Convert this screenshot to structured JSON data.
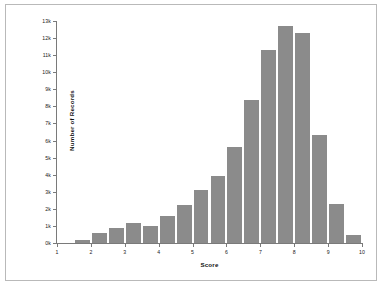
{
  "chart_data": {
    "type": "bar",
    "title": "",
    "subtitle": "",
    "xlabel": "Score",
    "ylabel": "Number of Records",
    "xlim": [
      1,
      10
    ],
    "ylim": [
      0,
      13000
    ],
    "grid": false,
    "legend": null,
    "bin_width": 0.5,
    "bar_color": "#8b8b8b",
    "y_ticks": [
      0,
      1000,
      2000,
      3000,
      4000,
      5000,
      6000,
      7000,
      8000,
      9000,
      10000,
      11000,
      12000,
      13000
    ],
    "y_tick_labels": [
      "0k",
      "1k",
      "2k",
      "3k",
      "4k",
      "5k",
      "6k",
      "7k",
      "8k",
      "9k",
      "10k",
      "11k",
      "12k",
      "13k"
    ],
    "x_ticks": [
      1,
      2,
      3,
      4,
      5,
      6,
      7,
      8,
      9,
      10
    ],
    "x_tick_labels": [
      "1",
      "2",
      "3",
      "4",
      "5",
      "6",
      "7",
      "8",
      "9",
      "10"
    ],
    "bins": [
      {
        "start": 1.0,
        "end": 1.5,
        "center": 1.25,
        "value": 0
      },
      {
        "start": 1.5,
        "end": 2.0,
        "center": 1.75,
        "value": 150
      },
      {
        "start": 2.0,
        "end": 2.5,
        "center": 2.25,
        "value": 600
      },
      {
        "start": 2.5,
        "end": 3.0,
        "center": 2.75,
        "value": 900
      },
      {
        "start": 3.0,
        "end": 3.5,
        "center": 3.25,
        "value": 1200
      },
      {
        "start": 3.5,
        "end": 4.0,
        "center": 3.75,
        "value": 1000
      },
      {
        "start": 4.0,
        "end": 4.5,
        "center": 4.25,
        "value": 1600
      },
      {
        "start": 4.5,
        "end": 5.0,
        "center": 4.75,
        "value": 2200
      },
      {
        "start": 5.0,
        "end": 5.5,
        "center": 5.25,
        "value": 3100
      },
      {
        "start": 5.5,
        "end": 6.0,
        "center": 5.75,
        "value": 3900
      },
      {
        "start": 6.0,
        "end": 6.5,
        "center": 6.25,
        "value": 5600
      },
      {
        "start": 6.5,
        "end": 7.0,
        "center": 6.75,
        "value": 8400
      },
      {
        "start": 7.0,
        "end": 7.5,
        "center": 7.25,
        "value": 11300
      },
      {
        "start": 7.5,
        "end": 8.0,
        "center": 7.75,
        "value": 12700
      },
      {
        "start": 8.0,
        "end": 8.5,
        "center": 8.25,
        "value": 12300
      },
      {
        "start": 8.5,
        "end": 9.0,
        "center": 8.75,
        "value": 6300
      },
      {
        "start": 9.0,
        "end": 9.5,
        "center": 9.25,
        "value": 2300
      },
      {
        "start": 9.5,
        "end": 10.0,
        "center": 9.75,
        "value": 450
      },
      {
        "start": 10.0,
        "end": 10.5,
        "center": 10.25,
        "value": 120
      }
    ],
    "categories": [
      "1.25",
      "1.75",
      "2.25",
      "2.75",
      "3.25",
      "3.75",
      "4.25",
      "4.75",
      "5.25",
      "5.75",
      "6.25",
      "6.75",
      "7.25",
      "7.75",
      "8.25",
      "8.75",
      "9.25",
      "9.75",
      "10.25"
    ],
    "values": [
      0,
      150,
      600,
      900,
      1200,
      1000,
      1600,
      2200,
      3100,
      3900,
      5600,
      8400,
      11300,
      12700,
      12300,
      6300,
      2300,
      450,
      120
    ]
  }
}
